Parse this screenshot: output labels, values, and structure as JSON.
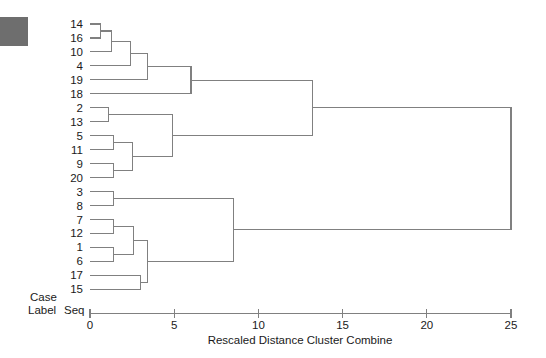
{
  "figure": {
    "axis_title": "Rescaled Distance Cluster Combine",
    "case_label_line1": "Case",
    "case_label_line2": "Label",
    "seq_label": "Seq",
    "line_color": "#808080",
    "text_color": "#1a1a1a",
    "background": "#ffffff",
    "swatch_color": "#6e6e6e"
  },
  "chart_data": {
    "type": "dendrogram",
    "title": "",
    "xlabel": "Rescaled Distance Cluster Combine",
    "ylabel": "Case Label Seq",
    "xlim": [
      0,
      25
    ],
    "xticks": [
      0,
      5,
      10,
      15,
      20,
      25
    ],
    "xtick_labels": [
      "0",
      "5",
      "10",
      "15",
      "20",
      "25"
    ],
    "grid": false,
    "legend": "none",
    "orientation": "horizontal",
    "leaf_order": [
      14,
      16,
      10,
      4,
      19,
      18,
      2,
      13,
      5,
      11,
      9,
      20,
      3,
      8,
      7,
      12,
      1,
      6,
      17,
      15
    ],
    "leaf_labels": [
      "14",
      "16",
      "10",
      "4",
      "19",
      "18",
      "2",
      "13",
      "5",
      "11",
      "9",
      "20",
      "3",
      "8",
      "7",
      "12",
      "1",
      "6",
      "17",
      "15"
    ],
    "n_leaves": 20,
    "merges": [
      {
        "id": "m1",
        "left": "14",
        "right": "16",
        "distance": 0.6
      },
      {
        "id": "m2",
        "left": "m1",
        "right": "10",
        "distance": 1.3
      },
      {
        "id": "m3",
        "left": "m2",
        "right": "4",
        "distance": 2.4
      },
      {
        "id": "m4",
        "left": "m3",
        "right": "19",
        "distance": 3.4
      },
      {
        "id": "m5",
        "left": "m4",
        "right": "18",
        "distance": 6.0
      },
      {
        "id": "m6",
        "left": "2",
        "right": "13",
        "distance": 1.1
      },
      {
        "id": "m7",
        "left": "5",
        "right": "11",
        "distance": 1.4
      },
      {
        "id": "m8",
        "left": "9",
        "right": "20",
        "distance": 1.4
      },
      {
        "id": "m9",
        "left": "m7",
        "right": "m8",
        "distance": 2.5
      },
      {
        "id": "m10",
        "left": "m6",
        "right": "m9",
        "distance": 4.9
      },
      {
        "id": "m11",
        "left": "m5",
        "right": "m10",
        "distance": 13.2
      },
      {
        "id": "m12",
        "left": "3",
        "right": "8",
        "distance": 1.4
      },
      {
        "id": "m13",
        "left": "7",
        "right": "12",
        "distance": 1.4
      },
      {
        "id": "m14",
        "left": "1",
        "right": "6",
        "distance": 1.4
      },
      {
        "id": "m15",
        "left": "m13",
        "right": "m14",
        "distance": 2.6
      },
      {
        "id": "m16",
        "left": "17",
        "right": "15",
        "distance": 3.0
      },
      {
        "id": "m17",
        "left": "m15",
        "right": "m16",
        "distance": 3.4
      },
      {
        "id": "m18",
        "left": "m12",
        "right": "m17",
        "distance": 8.5
      },
      {
        "id": "m19",
        "left": "m11",
        "right": "m18",
        "distance": 25.0
      }
    ]
  }
}
